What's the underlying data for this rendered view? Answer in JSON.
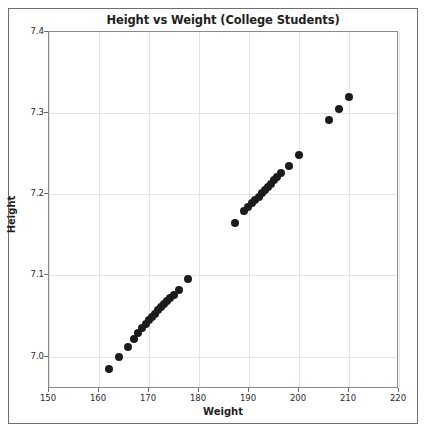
{
  "chart_data": {
    "type": "scatter",
    "title": "Height vs Weight (College Students)",
    "xlabel": "Weight",
    "ylabel": "Height",
    "xlim": [
      150,
      220
    ],
    "ylim": [
      6.96,
      7.4
    ],
    "xticks": [
      150,
      160,
      170,
      180,
      190,
      200,
      210,
      220
    ],
    "yticks": [
      7.0,
      7.1,
      7.2,
      7.3,
      7.4
    ],
    "xtick_labels": [
      "150",
      "160",
      "170",
      "180",
      "190",
      "200",
      "210",
      "220"
    ],
    "ytick_labels": [
      "7.0",
      "7.1",
      "7.2",
      "7.3",
      "7.4"
    ],
    "grid": true,
    "legend": null,
    "marker_color": "#1b1b1b",
    "marker_size": 8,
    "series": [
      {
        "name": "students",
        "x": [
          162.0,
          163.9,
          165.8,
          167.0,
          167.8,
          168.6,
          169.3,
          170.0,
          170.6,
          171.2,
          171.8,
          172.4,
          173.0,
          173.6,
          174.2,
          174.9,
          175.9,
          177.8,
          187.2,
          189.0,
          189.8,
          190.5,
          191.2,
          191.9,
          192.5,
          193.1,
          193.7,
          194.3,
          194.9,
          195.6,
          196.4,
          198.0,
          200.0,
          206.0,
          208.0,
          210.0
        ],
        "y": [
          6.985,
          6.999,
          7.012,
          7.022,
          7.029,
          7.035,
          7.04,
          7.045,
          7.049,
          7.053,
          7.057,
          7.061,
          7.065,
          7.069,
          7.072,
          7.076,
          7.082,
          7.096,
          7.165,
          7.179,
          7.184,
          7.189,
          7.193,
          7.197,
          7.201,
          7.205,
          7.209,
          7.213,
          7.217,
          7.221,
          7.226,
          7.235,
          7.249,
          7.291,
          7.305,
          7.32
        ]
      }
    ]
  },
  "figure": {
    "title": "Height vs Weight (College Students)",
    "xlabel": "Weight",
    "ylabel": "Height"
  }
}
